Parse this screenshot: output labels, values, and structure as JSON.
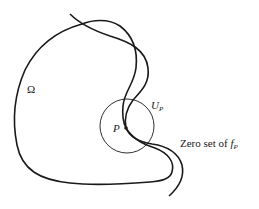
{
  "labels": {
    "domain": "Ω",
    "neighborhood": "U",
    "neighborhood_sub": "P",
    "point": "P",
    "zero_set_prefix": "Zero set of ",
    "zero_set_fn": "f",
    "zero_set_sub": "P"
  },
  "colors": {
    "stroke": "#1a1a1a",
    "background": "#ffffff"
  },
  "geometry": {
    "circle": {
      "cx": 127,
      "cy": 126,
      "r": 27
    },
    "point": {
      "cx": 126,
      "cy": 128,
      "r": 1.8
    }
  }
}
